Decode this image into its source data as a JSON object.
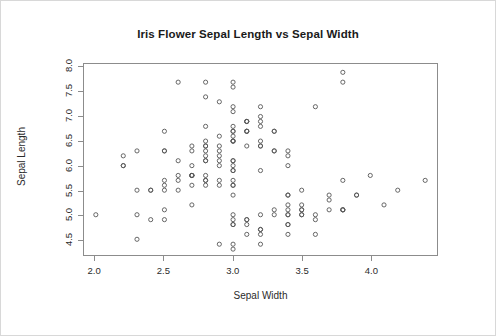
{
  "chart_data": {
    "type": "scatter",
    "title": "Iris Flower Sepal Length vs Sepal Width",
    "xlabel": "Sepal Width",
    "ylabel": "Sepal Length",
    "xlim": [
      1.92,
      4.48
    ],
    "ylim": [
      4.18,
      8.07
    ],
    "xticks": [
      "2.0",
      "2.5",
      "3.0",
      "3.5",
      "4.0"
    ],
    "xtick_values": [
      2.0,
      2.5,
      3.0,
      3.5,
      4.0
    ],
    "yticks": [
      "4.5",
      "5.0",
      "5.5",
      "6.0",
      "6.5",
      "7.0",
      "7.5",
      "8.0"
    ],
    "ytick_values": [
      4.5,
      5.0,
      5.5,
      6.0,
      6.5,
      7.0,
      7.5,
      8.0
    ],
    "grid": false,
    "legend": null,
    "marker": "open-circle",
    "marker_color": "#555555",
    "n_points": 150,
    "x": [
      3.5,
      3.0,
      3.2,
      3.1,
      3.6,
      3.9,
      3.4,
      3.4,
      2.9,
      3.1,
      3.7,
      3.4,
      3.0,
      3.0,
      4.0,
      4.4,
      3.9,
      3.5,
      3.8,
      3.8,
      3.4,
      3.7,
      3.6,
      3.3,
      3.4,
      3.0,
      3.4,
      3.5,
      3.4,
      3.2,
      3.1,
      3.4,
      4.1,
      4.2,
      3.1,
      3.2,
      3.5,
      3.6,
      3.0,
      3.4,
      3.5,
      2.3,
      3.2,
      3.5,
      3.8,
      3.0,
      3.8,
      3.2,
      3.7,
      3.3,
      3.2,
      3.2,
      3.1,
      2.3,
      2.8,
      2.8,
      3.3,
      2.4,
      2.9,
      2.7,
      2.0,
      3.0,
      2.2,
      2.9,
      2.9,
      3.1,
      3.0,
      2.7,
      2.2,
      2.5,
      3.2,
      2.8,
      2.5,
      2.8,
      2.9,
      3.0,
      2.8,
      3.0,
      2.9,
      2.6,
      2.4,
      2.4,
      2.7,
      2.7,
      3.0,
      3.4,
      3.1,
      2.3,
      3.0,
      2.5,
      2.6,
      3.0,
      2.6,
      2.3,
      2.7,
      3.0,
      2.9,
      2.9,
      2.5,
      2.8,
      3.3,
      2.7,
      3.0,
      2.9,
      3.0,
      3.0,
      2.5,
      2.9,
      2.5,
      3.6,
      3.2,
      2.7,
      3.0,
      2.5,
      2.8,
      3.2,
      3.0,
      3.8,
      2.6,
      2.2,
      3.2,
      2.8,
      2.8,
      2.7,
      3.3,
      3.2,
      2.8,
      3.0,
      2.8,
      3.0,
      2.8,
      3.8,
      2.8,
      2.8,
      2.6,
      3.0,
      3.4,
      3.1,
      3.0,
      3.1,
      3.1,
      3.1,
      2.7,
      3.2,
      3.3,
      3.0,
      2.5,
      3.0,
      3.4,
      3.0
    ],
    "y": [
      5.1,
      4.9,
      4.7,
      4.6,
      5.0,
      5.4,
      4.6,
      5.0,
      4.4,
      4.9,
      5.4,
      4.8,
      4.8,
      4.3,
      5.8,
      5.7,
      5.4,
      5.1,
      5.7,
      5.1,
      5.4,
      5.1,
      4.6,
      5.1,
      4.8,
      5.0,
      5.0,
      5.2,
      5.2,
      4.7,
      4.8,
      5.4,
      5.2,
      5.5,
      4.9,
      5.0,
      5.5,
      4.9,
      4.4,
      5.1,
      5.0,
      4.5,
      4.4,
      5.0,
      5.1,
      4.8,
      5.1,
      4.6,
      5.3,
      5.0,
      7.0,
      6.4,
      6.9,
      5.5,
      6.5,
      5.7,
      6.3,
      4.9,
      6.6,
      5.2,
      5.0,
      5.9,
      6.0,
      6.1,
      5.6,
      6.7,
      5.6,
      5.8,
      6.2,
      5.6,
      5.9,
      6.1,
      6.3,
      6.1,
      6.4,
      6.6,
      6.8,
      6.7,
      6.0,
      5.7,
      5.5,
      5.5,
      5.8,
      6.0,
      5.4,
      6.0,
      6.7,
      6.3,
      5.6,
      5.5,
      5.5,
      6.1,
      5.8,
      5.0,
      5.6,
      5.7,
      5.7,
      6.2,
      5.1,
      5.7,
      6.3,
      5.8,
      7.1,
      6.3,
      6.5,
      7.6,
      4.9,
      7.3,
      6.7,
      7.2,
      6.5,
      6.4,
      6.8,
      5.7,
      5.8,
      6.4,
      6.5,
      7.7,
      7.7,
      6.0,
      6.9,
      5.6,
      7.7,
      6.3,
      6.7,
      7.2,
      6.2,
      6.1,
      6.4,
      7.2,
      7.4,
      7.9,
      6.4,
      6.3,
      6.1,
      7.7,
      6.3,
      6.4,
      6.0,
      6.9,
      6.7,
      6.9,
      5.8,
      6.8,
      6.7,
      6.7,
      6.3,
      6.5,
      6.2,
      5.9
    ]
  },
  "style": {
    "frame_color": "#8c8c8c",
    "text_color": "#2b2b2b",
    "title_color": "#1a1a1a",
    "marker_color": "#555555",
    "background": "#ffffff"
  }
}
